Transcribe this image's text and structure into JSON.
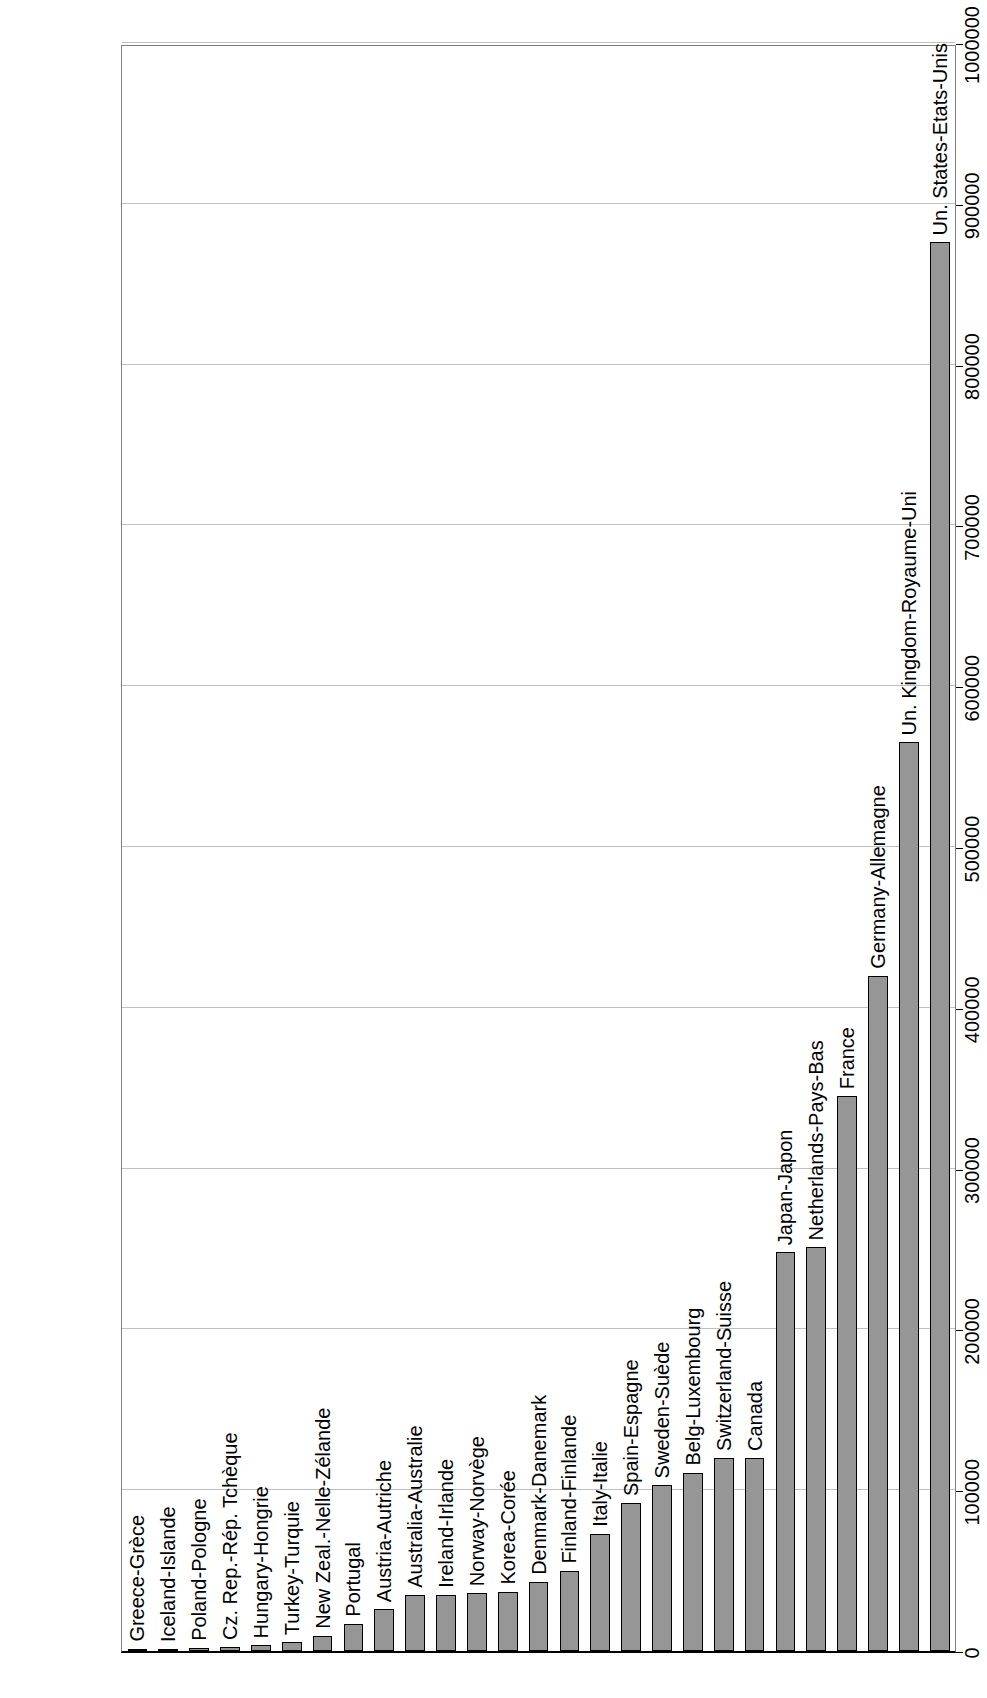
{
  "chart_data": {
    "type": "bar",
    "orientation": "horizontal",
    "title": "",
    "xlabel": "In $US million - En millions de $EU",
    "ylabel": "",
    "xlim": [
      0,
      1000000
    ],
    "grid": true,
    "legend": "none",
    "tick_labels": [
      "0",
      "100000",
      "200000",
      "300000",
      "400000",
      "500000",
      "600000",
      "700000",
      "800000",
      "900000",
      "1000000"
    ],
    "ticks": [
      0,
      100000,
      200000,
      300000,
      400000,
      500000,
      600000,
      700000,
      800000,
      900000,
      1000000
    ],
    "categories": [
      "Greece-Grèce",
      "Iceland-Islande",
      "Poland-Pologne",
      "Cz. Rep.-Rép. Tchèque",
      "Hungary-Hongrie",
      "Turkey-Turquie",
      "New Zeal.-Nelle-Zélande",
      "Portugal",
      "Austria-Autriche",
      "Australia-Australie",
      "Ireland-Irlande",
      "Norway-Norvège",
      "Korea-Corée",
      "Denmark-Danemark",
      "Finland-Finlande",
      "Italy-Italie",
      "Spain-Espagne",
      "Sweden-Suède",
      "Belg-Luxembourg",
      "Switzerland-Suisse",
      "Canada",
      "Japan-Japon",
      "Netherlands-Pays-Bas",
      "France",
      "Germany-Allemagne",
      "Un. Kingdom-Royaume-Uni",
      "Un. States-Etats-Unis"
    ],
    "values": [
      1500,
      1200,
      2000,
      2500,
      3500,
      5500,
      9500,
      17000,
      26000,
      35000,
      35000,
      36000,
      37000,
      43000,
      50000,
      73000,
      92000,
      103000,
      111000,
      120000,
      120000,
      248000,
      251000,
      345000,
      420000,
      565000,
      876000
    ],
    "bar_color": "#969696",
    "bar_edge_color": "#000000",
    "gridline_color": "#bfbfbf",
    "axis_color": "#000000"
  }
}
